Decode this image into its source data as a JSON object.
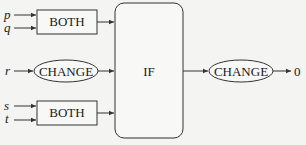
{
  "diagram": {
    "inputs": {
      "p": "p",
      "q": "q",
      "r": "r",
      "s": "s",
      "t": "t"
    },
    "nodes": {
      "both_top": "BOTH",
      "change_mid": "CHANGE",
      "both_bottom": "BOTH",
      "if_block": "IF",
      "change_out": "CHANGE"
    },
    "output": "0",
    "colors": {
      "background": "#f4f4f2",
      "stroke": "#333333",
      "text": "#1a1a1a"
    }
  }
}
